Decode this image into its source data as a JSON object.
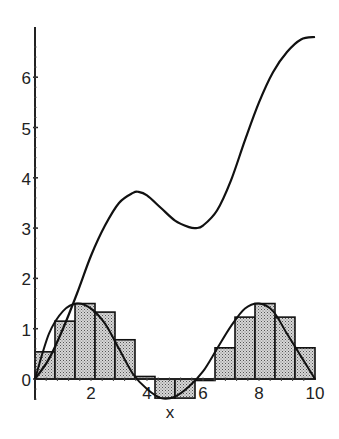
{
  "chart_data": {
    "type": "line",
    "title": "",
    "xlabel": "x",
    "ylabel": "",
    "xlim": [
      0,
      10
    ],
    "ylim": [
      -0.5,
      7
    ],
    "grid": false,
    "x_ticks": [
      "2",
      "4",
      "6",
      "8",
      "10"
    ],
    "y_ticks": [
      "0",
      "1",
      "2",
      "3",
      "4",
      "5",
      "6"
    ],
    "series": [
      {
        "name": "accumulated area (upper curve)",
        "x": [
          0,
          0.5,
          1,
          1.5,
          2,
          2.5,
          3,
          3.5,
          3.7,
          4,
          4.5,
          5,
          5.5,
          5.75,
          6,
          6.5,
          7,
          7.5,
          8,
          8.5,
          9,
          9.5,
          10
        ],
        "values": [
          0,
          0.4,
          1.0,
          1.7,
          2.45,
          3.05,
          3.5,
          3.7,
          3.72,
          3.65,
          3.4,
          3.15,
          3.02,
          3.0,
          3.05,
          3.35,
          3.95,
          4.75,
          5.5,
          6.1,
          6.5,
          6.75,
          6.8
        ]
      },
      {
        "name": "integrand (oscillating curve)",
        "x": [
          0,
          0.5,
          1,
          1.5,
          2,
          2.5,
          3,
          3.5,
          4,
          4.5,
          5,
          5.5,
          6,
          6.5,
          7,
          7.5,
          8,
          8.5,
          9,
          9.5,
          10
        ],
        "values": [
          0,
          0.9,
          1.35,
          1.5,
          1.4,
          1.1,
          0.6,
          0.1,
          -0.2,
          -0.38,
          -0.35,
          -0.15,
          0.15,
          0.6,
          1.05,
          1.4,
          1.5,
          1.35,
          0.9,
          0.45,
          0.0
        ]
      }
    ],
    "riemann_rectangles": {
      "count": 14,
      "width": 0.714,
      "left_edges": [
        0,
        0.714,
        1.429,
        2.143,
        2.857,
        3.571,
        4.286,
        5.0,
        5.714,
        6.429,
        7.143,
        7.857,
        8.571,
        9.286
      ],
      "heights": [
        0.54,
        1.15,
        1.5,
        1.33,
        0.78,
        0.05,
        -0.38,
        -0.38,
        0.0,
        0.62,
        1.23,
        1.5,
        1.23,
        0.62
      ]
    }
  },
  "axes": {
    "x_label": "x",
    "x_tick_labels": [
      "2",
      "4",
      "6",
      "8",
      "10"
    ],
    "y_tick_labels": [
      "0",
      "1",
      "2",
      "3",
      "4",
      "5",
      "6"
    ]
  },
  "colors": {
    "curve": "#111111",
    "rect_fill": "#bdbdbd",
    "rect_stroke": "#111111",
    "axis": "#222222"
  }
}
